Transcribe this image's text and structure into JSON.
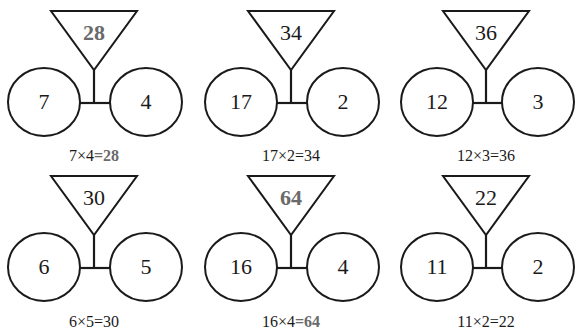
{
  "colors": {
    "stroke": "#1a1a1a",
    "text": "#1a1a1a",
    "highlight": "#6a6a6a",
    "background": "#ffffff"
  },
  "puzzles": [
    {
      "product": "28",
      "left": "7",
      "right": "4",
      "equation_lhs": "7×4",
      "equation_rhs": "=28",
      "highlighted": true
    },
    {
      "product": "34",
      "left": "17",
      "right": "2",
      "equation_lhs": "17×2",
      "equation_rhs": "=34",
      "highlighted": false
    },
    {
      "product": "36",
      "left": "12",
      "right": "3",
      "equation_lhs": "12×3",
      "equation_rhs": "=36",
      "highlighted": false
    },
    {
      "product": "30",
      "left": "6",
      "right": "5",
      "equation_lhs": "6×5",
      "equation_rhs": "=30",
      "highlighted": false
    },
    {
      "product": "64",
      "left": "16",
      "right": "4",
      "equation_lhs": "16×4",
      "equation_rhs": "=64",
      "highlighted": true
    },
    {
      "product": "22",
      "left": "11",
      "right": "2",
      "equation_lhs": "11×2",
      "equation_rhs": "=22",
      "highlighted": false
    }
  ]
}
